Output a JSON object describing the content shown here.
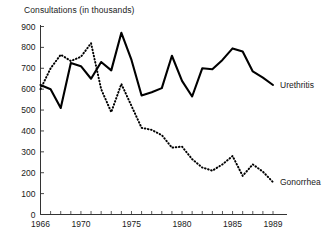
{
  "chart_data": {
    "type": "line",
    "title": "Consultations (in thousands)",
    "xlabel": "",
    "ylabel": "",
    "ylim": [
      0,
      900
    ],
    "xlim": [
      1966,
      1989
    ],
    "yticks": [
      0,
      100,
      200,
      300,
      400,
      500,
      600,
      700,
      800,
      900
    ],
    "ytick_labels": [
      "0",
      "100",
      "200",
      "300",
      "400",
      "500",
      "600",
      "700",
      "800",
      "900"
    ],
    "xticks": [
      1966,
      1967,
      1968,
      1969,
      1970,
      1971,
      1972,
      1973,
      1974,
      1975,
      1976,
      1977,
      1978,
      1979,
      1980,
      1981,
      1982,
      1983,
      1984,
      1985,
      1986,
      1987,
      1988,
      1989
    ],
    "xtick_labels_shown": [
      "1966",
      "1970",
      "1975",
      "1980",
      "1985",
      "1989"
    ],
    "xtick_labeled_values": [
      1966,
      1970,
      1975,
      1980,
      1985,
      1989
    ],
    "grid": false,
    "legend_position": "right-inline",
    "x": [
      1966,
      1967,
      1968,
      1969,
      1970,
      1971,
      1972,
      1973,
      1974,
      1975,
      1976,
      1977,
      1978,
      1979,
      1980,
      1981,
      1982,
      1983,
      1984,
      1985,
      1986,
      1987,
      1988,
      1989
    ],
    "series": [
      {
        "name": "Urethritis",
        "style": "solid",
        "color": "#000000",
        "values": [
          620,
          600,
          510,
          725,
          710,
          650,
          730,
          690,
          870,
          740,
          570,
          585,
          605,
          760,
          640,
          565,
          700,
          695,
          740,
          795,
          780,
          685,
          655,
          620
        ]
      },
      {
        "name": "Gonorrhea",
        "style": "dotted",
        "color": "#000000",
        "values": [
          600,
          700,
          765,
          735,
          755,
          820,
          600,
          490,
          625,
          520,
          415,
          405,
          380,
          320,
          325,
          265,
          225,
          210,
          240,
          280,
          185,
          240,
          205,
          155
        ]
      }
    ]
  },
  "labels": {
    "urethritis": "Urethritis",
    "gonorrhea": "Gonorrhea"
  }
}
